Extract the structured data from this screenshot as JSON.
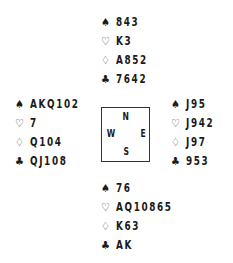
{
  "suits": {
    "spades": "♠",
    "hearts": "♡",
    "diamonds": "♢",
    "clubs": "♣"
  },
  "compass": {
    "north": "N",
    "south": "S",
    "west": "W",
    "east": "E"
  },
  "hands": {
    "north": {
      "spades": "843",
      "hearts": "K3",
      "diamonds": "A852",
      "clubs": "7642"
    },
    "west": {
      "spades": "AKQ102",
      "hearts": "7",
      "diamonds": "Q104",
      "clubs": "QJ108"
    },
    "east": {
      "spades": "J95",
      "hearts": "J942",
      "diamonds": "J97",
      "clubs": "953"
    },
    "south": {
      "spades": "76",
      "hearts": "AQ10865",
      "diamonds": "K63",
      "clubs": "AK"
    }
  }
}
